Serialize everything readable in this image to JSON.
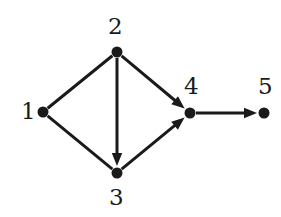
{
  "figure": {
    "kind": "directed-graph",
    "width": 281,
    "height": 217,
    "background_color": "#ffffff",
    "stroke_color": "#1a1a1a",
    "node_fill_color": "#1a1a1a",
    "label_color": "#1a1a1a",
    "edge_width": 3,
    "node_radius": 5.5
  },
  "nodes": [
    {
      "id": "1",
      "label": "1",
      "x": 43,
      "y": 112,
      "label_x": 21,
      "label_y": 100,
      "label_anchor": "left"
    },
    {
      "id": "2",
      "label": "2",
      "x": 117,
      "y": 52,
      "label_x": 108,
      "label_y": 15,
      "label_anchor": "above"
    },
    {
      "id": "3",
      "label": "3",
      "x": 117,
      "y": 173,
      "label_x": 109,
      "label_y": 186,
      "label_anchor": "below"
    },
    {
      "id": "4",
      "label": "4",
      "x": 190,
      "y": 113,
      "label_x": 184,
      "label_y": 75,
      "label_anchor": "above"
    },
    {
      "id": "5",
      "label": "5",
      "x": 264,
      "y": 113,
      "label_x": 258,
      "label_y": 75,
      "label_anchor": "above"
    }
  ],
  "edges": [
    {
      "id": "e1-2",
      "from": "1",
      "to": "2",
      "directed": false,
      "arrowhead": false
    },
    {
      "id": "e1-3",
      "from": "1",
      "to": "3",
      "directed": false,
      "arrowhead": false
    },
    {
      "id": "e2-3",
      "from": "2",
      "to": "3",
      "directed": true,
      "arrowhead": true
    },
    {
      "id": "e2-4",
      "from": "2",
      "to": "4",
      "directed": true,
      "arrowhead": true
    },
    {
      "id": "e3-4",
      "from": "3",
      "to": "4",
      "directed": true,
      "arrowhead": true
    },
    {
      "id": "e4-5",
      "from": "4",
      "to": "5",
      "directed": true,
      "arrowhead": true
    }
  ]
}
